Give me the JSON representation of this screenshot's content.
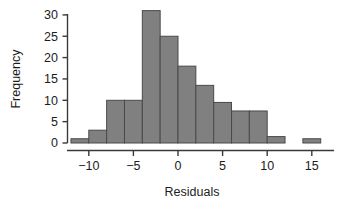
{
  "chart_data": {
    "type": "bar",
    "subtype": "histogram",
    "title": "",
    "xlabel": "Residuals",
    "ylabel": "Frequency",
    "xlim": [
      -12.5,
      16.5
    ],
    "ylim": [
      0,
      31.5
    ],
    "grid": false,
    "legend": null,
    "bin_width": 2,
    "bin_edges": [
      -12,
      -10,
      -8,
      -6,
      -4,
      -2,
      0,
      2,
      4,
      6,
      8,
      10,
      12,
      14,
      16
    ],
    "bin_centers": [
      -11,
      -9,
      -7,
      -5,
      -3,
      -1,
      1,
      3,
      5,
      7,
      9,
      11,
      13,
      15
    ],
    "values": [
      1,
      3,
      10,
      10,
      31,
      25,
      18,
      13.5,
      9.5,
      7.5,
      7.5,
      1.5,
      0,
      1
    ],
    "categories": [
      "-12 to -10",
      "-10 to -8",
      "-8 to -6",
      "-6 to -4",
      "-4 to -2",
      "-2 to 0",
      "0 to 2",
      "2 to 4",
      "4 to 6",
      "6 to 8",
      "8 to 10",
      "10 to 12",
      "12 to 14",
      "14 to 16"
    ],
    "xticks": [
      -10,
      -5,
      0,
      5,
      10,
      15
    ],
    "xticklabels": [
      "-10",
      "-5",
      "0",
      "5",
      "10",
      "15"
    ],
    "yticks": [
      0,
      5,
      10,
      15,
      20,
      25,
      30
    ],
    "yticklabels": [
      "0",
      "5",
      "10",
      "15",
      "20",
      "25",
      "30"
    ],
    "colors": {
      "bar_fill": "#808080",
      "bar_stroke": "#4a4a4a",
      "axis": "#3a3a3a",
      "text": "#1c1c1c",
      "background": "#ffffff"
    }
  },
  "axes": {
    "x_title": "Residuals",
    "y_title": "Frequency"
  },
  "ticks": {
    "x": [
      "-10",
      "-5",
      "0",
      "5",
      "10",
      "15"
    ],
    "y": [
      "0",
      "5",
      "10",
      "15",
      "20",
      "25",
      "30"
    ]
  }
}
